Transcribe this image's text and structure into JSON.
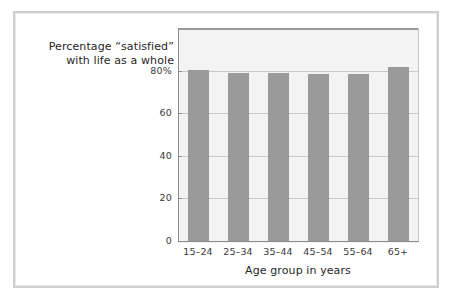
{
  "chart_data": {
    "type": "bar",
    "title": "",
    "subtitle": "",
    "ylabel_line1": "Percentage “satisfied”",
    "ylabel_line2": "with life as a whole",
    "xlabel": "Age group in years",
    "categories": [
      "15–24",
      "25–34",
      "35–44",
      "45–54",
      "55–64",
      "65+"
    ],
    "values": [
      80.5,
      79.0,
      78.8,
      78.3,
      78.6,
      81.8
    ],
    "ytick_labels": [
      "0",
      "20",
      "40",
      "60",
      "80%"
    ],
    "ytick_values": [
      0,
      20,
      40,
      60,
      80
    ],
    "ylim": [
      0,
      100
    ],
    "grid": true,
    "legend": "none",
    "bar_color": "#9a9a9a",
    "plot_background": "#f3f3f3",
    "frame_color": "#cfcfcf",
    "gridline_color": "#c9c9c9",
    "axis_color": "#8d8d8d"
  }
}
